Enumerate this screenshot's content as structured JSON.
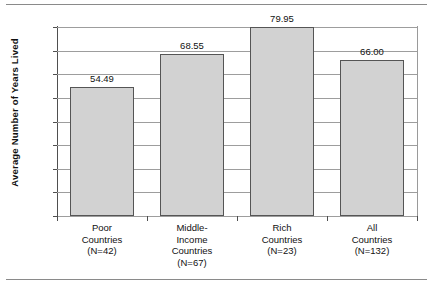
{
  "chart_data": {
    "type": "bar",
    "title": "",
    "xlabel": "",
    "ylabel": "Average Number of Years Lived",
    "ylim": [
      0,
      80
    ],
    "ytick_step": 10,
    "grid": true,
    "legend": null,
    "categories": [
      "Poor Countries (N=42)",
      "Middle-Income Countries (N=67)",
      "Rich Countries (N=23)",
      "All Countries (N=132)"
    ],
    "category_lines": [
      [
        "Poor",
        "Countries",
        "(N=42)"
      ],
      [
        "Middle-",
        "Income",
        "Countries",
        "(N=67)"
      ],
      [
        "Rich",
        "Countries",
        "(N=23)"
      ],
      [
        "All",
        "Countries",
        "(N=132)"
      ]
    ],
    "values": [
      54.49,
      68.55,
      79.95,
      66.0
    ],
    "value_labels": [
      "54.49",
      "68.55",
      "79.95",
      "66.00"
    ],
    "ytick_labels": [
      "80.00",
      "70.00",
      "60.00",
      "50.00",
      "40.00",
      "30.00",
      "20.00",
      "10.00",
      "0.00"
    ],
    "ytick_values": [
      80,
      70,
      60,
      50,
      40,
      30,
      20,
      10,
      0
    ],
    "colors": {
      "bar_fill": "#d2d2d2",
      "bar_border": "#555555",
      "gridline": "#9d9d9d",
      "axis": "#4f4f4f",
      "text": "#111111",
      "background": "#ffffff",
      "rule": "#8a8a8a"
    }
  }
}
